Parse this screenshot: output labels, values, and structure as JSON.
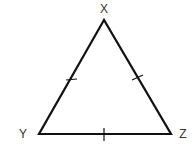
{
  "diagram": {
    "type": "equilateral-triangle",
    "vertices": [
      {
        "name": "X",
        "x": 104,
        "y": 20,
        "label_x": 104,
        "label_y": 13
      },
      {
        "name": "Y",
        "x": 39,
        "y": 134,
        "label_x": 23,
        "label_y": 138
      },
      {
        "name": "Z",
        "x": 171,
        "y": 134,
        "label_x": 183,
        "label_y": 138
      }
    ],
    "sides": [
      {
        "name": "XY",
        "tick_marks": 1
      },
      {
        "name": "XZ",
        "tick_marks": 1
      },
      {
        "name": "YZ",
        "tick_marks": 1
      }
    ],
    "stroke_color": "#111111",
    "label_color": "#333333"
  }
}
